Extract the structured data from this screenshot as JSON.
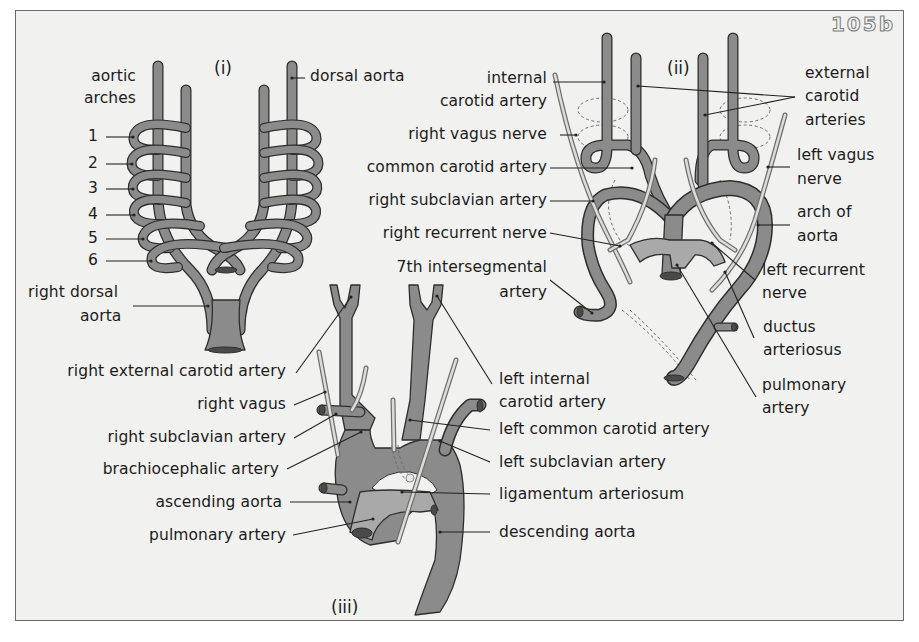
{
  "figure": {
    "id_label": "105b",
    "colors": {
      "background": "#f1f1ef",
      "vessel_fill": "#8b8b8b",
      "vessel_outline": "#2e2e2e",
      "pulmonary_fill": "#a9a9a9",
      "nerve_fill": "#d9d9d6",
      "text": "#1c1c1c",
      "border": "#6a6a6a"
    }
  },
  "panel_i": {
    "title": "(i)",
    "labels": {
      "aortic_arches_1": "aortic",
      "aortic_arches_2": "arches",
      "arch_1": "1",
      "arch_2": "2",
      "arch_3": "3",
      "arch_4": "4",
      "arch_5": "5",
      "arch_6": "6",
      "dorsal_aorta": "dorsal aorta",
      "right_dorsal_aorta_1": "right dorsal",
      "right_dorsal_aorta_2": "aorta"
    }
  },
  "panel_ii": {
    "title": "(ii)",
    "labels": {
      "internal_carotid_1": "internal",
      "internal_carotid_2": "carotid artery",
      "right_vagus_nerve": "right vagus nerve",
      "common_carotid": "common carotid artery",
      "right_subclavian": "right subclavian artery",
      "right_recurrent_nerve": "right recurrent nerve",
      "seventh_intersegmental_1": "7th intersegmental",
      "seventh_intersegmental_2": "artery",
      "external_carotid_1": "external",
      "external_carotid_2": "carotid",
      "external_carotid_3": "arteries",
      "left_vagus_1": "left vagus",
      "left_vagus_2": "nerve",
      "arch_of_aorta_1": "arch of",
      "arch_of_aorta_2": "aorta",
      "left_recurrent_1": "left recurrent",
      "left_recurrent_2": "nerve",
      "ductus_1": "ductus",
      "ductus_2": "arteriosus",
      "pulmonary_1": "pulmonary",
      "pulmonary_2": "artery"
    }
  },
  "panel_iii": {
    "title": "(iii)",
    "labels": {
      "right_external_carotid": "right external carotid artery",
      "right_vagus": "right vagus",
      "right_subclavian": "right subclavian artery",
      "brachiocephalic": "brachiocephalic artery",
      "ascending_aorta": "ascending aorta",
      "pulmonary_artery": "pulmonary artery",
      "left_internal_carotid_1": "left internal",
      "left_internal_carotid_2": "carotid artery",
      "left_common_carotid": "left common carotid artery",
      "left_subclavian": "left subclavian artery",
      "ligamentum": "ligamentum arteriosum",
      "descending_aorta": "descending aorta"
    }
  }
}
